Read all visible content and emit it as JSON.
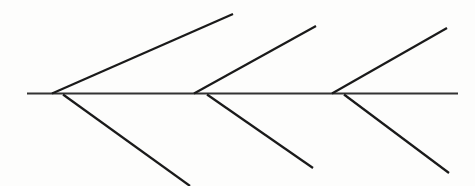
{
  "canvas": {
    "width": 475,
    "height": 186,
    "background_color": "#fdfdfc",
    "title": "Fishbone Diagram Skeleton"
  },
  "style": {
    "line_color": "#1a1a1a",
    "spine_color": "#333333",
    "spine_width": 1.8,
    "branch_width": 2.2
  },
  "chart_data": {
    "type": "diagram",
    "diagram_kind": "fishbone-ishikawa-skeleton",
    "title": "",
    "has_labels": false,
    "spine": {
      "name": "spine",
      "x1": 27,
      "y1": 93.5,
      "x2": 458,
      "y2": 93.5,
      "orientation": "horizontal"
    },
    "upper_branches": [
      {
        "name": "upper-branch-1",
        "x1": 52,
        "y1": 93.5,
        "x2": 233,
        "y2": 14,
        "angle_deg": -23.7
      },
      {
        "name": "upper-branch-2",
        "x1": 194,
        "y1": 93.5,
        "x2": 316,
        "y2": 26,
        "angle_deg": -28.9
      },
      {
        "name": "upper-branch-3",
        "x1": 332,
        "y1": 93.5,
        "x2": 447,
        "y2": 28,
        "angle_deg": -30.3
      }
    ],
    "lower_branches": [
      {
        "name": "lower-branch-1",
        "x1": 63,
        "y1": 94.5,
        "x2": 190,
        "y2": 186,
        "angle_deg": 35.8
      },
      {
        "name": "lower-branch-2",
        "x1": 207,
        "y1": 94.5,
        "x2": 313,
        "y2": 168,
        "angle_deg": 34.7
      },
      {
        "name": "lower-branch-3",
        "x1": 344,
        "y1": 94.5,
        "x2": 449,
        "y2": 173,
        "angle_deg": 36.8
      }
    ],
    "counts": {
      "spine_lines": 1,
      "upper_branch_lines": 3,
      "lower_branch_lines": 3,
      "total_lines": 7
    }
  }
}
